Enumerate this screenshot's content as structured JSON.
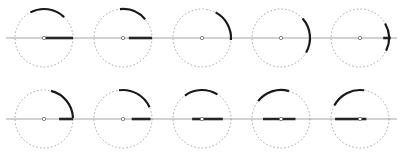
{
  "figure": {
    "width": 403,
    "height": 160,
    "background_color": "#ffffff",
    "rows": 2,
    "columns": 5,
    "panel_count": 10
  },
  "style": {
    "axis_color": "#9a9a9a",
    "circle_color": "#8d8d8d",
    "arc_color": "#1a1a1a",
    "bar_color": "#262626",
    "center_dot_fill": "#ffffff",
    "center_dot_stroke": "#6b6b6b",
    "circle_dash_pattern": "1.5 2.2",
    "circle_stroke_width": 0.8,
    "axis_stroke_width": 0.9,
    "arc_stroke_width": 2.2,
    "bar_stroke_width": 2.6,
    "center_dot_radius": 1.7
  },
  "geometry": {
    "radius": 29,
    "row_baselines": [
      38,
      119
    ],
    "column_centers": [
      44,
      123,
      202,
      281,
      360
    ],
    "axis_rows": [
      {
        "y": 38,
        "x1": 6,
        "x2": 397
      },
      {
        "y": 119,
        "x1": 6,
        "x2": 397
      }
    ]
  },
  "chart_data": {
    "type": "scatter",
    "xlabel": "",
    "ylabel": "",
    "grid": false,
    "legend": null,
    "panels": [
      {
        "index": 1,
        "row": 1,
        "column": 1,
        "cx": 44,
        "cy": 38,
        "r": 29,
        "arc_start_deg": -118,
        "arc_end_deg": -46,
        "arc_span_deg": 72,
        "bar_inner_frac": 0.04,
        "bar_outer_frac": 1.0,
        "bar_angle_deg": 0
      },
      {
        "index": 2,
        "row": 1,
        "column": 2,
        "cx": 123,
        "cy": 38,
        "r": 29,
        "arc_start_deg": -96,
        "arc_end_deg": -40,
        "arc_span_deg": 56,
        "bar_inner_frac": 0.2,
        "bar_outer_frac": 1.0,
        "bar_angle_deg": 0
      },
      {
        "index": 3,
        "row": 1,
        "column": 3,
        "cx": 202,
        "cy": 38,
        "r": 29,
        "arc_start_deg": -62,
        "arc_end_deg": 4,
        "arc_span_deg": 66,
        "bar_inner_frac": 1.0,
        "bar_outer_frac": 1.0,
        "bar_angle_deg": 0
      },
      {
        "index": 4,
        "row": 1,
        "column": 4,
        "cx": 281,
        "cy": 38,
        "r": 29,
        "arc_start_deg": -42,
        "arc_end_deg": 30,
        "arc_span_deg": 72,
        "bar_inner_frac": 1.0,
        "bar_outer_frac": 1.0,
        "bar_angle_deg": 0
      },
      {
        "index": 5,
        "row": 1,
        "column": 5,
        "cx": 360,
        "cy": 38,
        "r": 29,
        "arc_start_deg": -30,
        "arc_end_deg": 26,
        "arc_span_deg": 56,
        "bar_inner_frac": 0.8,
        "bar_outer_frac": 1.06,
        "bar_angle_deg": 0
      },
      {
        "index": 6,
        "row": 2,
        "column": 1,
        "cx": 44,
        "cy": 119,
        "r": 29,
        "arc_start_deg": -76,
        "arc_end_deg": -2,
        "arc_span_deg": 74,
        "bar_inner_frac": 0.52,
        "bar_outer_frac": 1.0,
        "bar_angle_deg": 0
      },
      {
        "index": 7,
        "row": 2,
        "column": 2,
        "cx": 123,
        "cy": 119,
        "r": 29,
        "arc_start_deg": -98,
        "arc_end_deg": -24,
        "arc_span_deg": 74,
        "bar_inner_frac": 0.3,
        "bar_outer_frac": 0.95,
        "bar_angle_deg": 0
      },
      {
        "index": 8,
        "row": 2,
        "column": 3,
        "cx": 202,
        "cy": 119,
        "r": 29,
        "arc_start_deg": -126,
        "arc_end_deg": -58,
        "arc_span_deg": 68,
        "bar_inner_frac": -0.34,
        "bar_outer_frac": 0.72,
        "bar_angle_deg": 0
      },
      {
        "index": 9,
        "row": 2,
        "column": 4,
        "cx": 281,
        "cy": 119,
        "r": 29,
        "arc_start_deg": -142,
        "arc_end_deg": -74,
        "arc_span_deg": 68,
        "bar_inner_frac": -0.62,
        "bar_outer_frac": 0.5,
        "bar_angle_deg": 0
      },
      {
        "index": 10,
        "row": 2,
        "column": 5,
        "cx": 360,
        "cy": 119,
        "r": 29,
        "arc_start_deg": -152,
        "arc_end_deg": -82,
        "arc_span_deg": 70,
        "bar_inner_frac": -0.86,
        "bar_outer_frac": 0.22,
        "bar_angle_deg": 0
      }
    ]
  }
}
